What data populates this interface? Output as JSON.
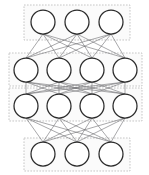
{
  "diagram": {
    "type": "feedforward-neural-network",
    "canvas": {
      "width": 149,
      "height": 175,
      "background": "#ffffff"
    },
    "style": {
      "node_fill": "#ffffff",
      "node_stroke": "#2b2b2b",
      "node_stroke_width": 1.25,
      "edge_color": "#58585c",
      "edge_width": 0.55,
      "group_box_fill": "#fbfbfb",
      "group_box_stroke": "#b9b9b9",
      "group_box_dash": "1.6 1.4"
    },
    "layers": [
      {
        "name": "layer-1",
        "role": "input-layer",
        "node_count": 3,
        "node_radius": 12,
        "y": 22,
        "node_x": [
          43,
          77,
          111
        ],
        "group_box": {
          "x": 24,
          "y": 5,
          "width": 106,
          "height": 35
        }
      },
      {
        "name": "layer-2",
        "role": "hidden-layer-1",
        "node_count": 4,
        "node_radius": 12,
        "y": 70,
        "node_x": [
          26,
          59,
          92,
          125
        ],
        "group_box": {
          "x": 9,
          "y": 53,
          "width": 133,
          "height": 33
        }
      },
      {
        "name": "layer-3",
        "role": "hidden-layer-2",
        "node_count": 4,
        "node_radius": 12,
        "y": 106,
        "node_x": [
          26,
          59,
          92,
          125
        ],
        "group_box": {
          "x": 9,
          "y": 88,
          "width": 133,
          "height": 33
        }
      },
      {
        "name": "layer-4",
        "role": "output-layer",
        "node_count": 3,
        "node_radius": 12,
        "y": 154,
        "node_x": [
          43,
          77,
          111
        ],
        "group_box": {
          "x": 24,
          "y": 138,
          "width": 106,
          "height": 33
        }
      }
    ],
    "connections": [
      {
        "name": "edges-layer1-to-layer2",
        "from": "layer-1",
        "to": "layer-2",
        "fully_connected": true,
        "count": 12
      },
      {
        "name": "edges-layer2-to-layer3",
        "from": "layer-2",
        "to": "layer-3",
        "fully_connected": true,
        "count": 16
      },
      {
        "name": "edges-layer3-to-layer4",
        "from": "layer-3",
        "to": "layer-4",
        "fully_connected": true,
        "count": 12
      }
    ]
  }
}
